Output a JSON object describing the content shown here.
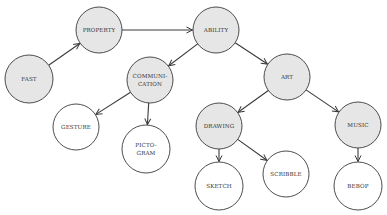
{
  "diagram": {
    "type": "concept-tree",
    "colors": {
      "filled": "#e6e6e6",
      "empty": "#ffffff",
      "stroke": "#3a3a3a",
      "text": "#333333"
    },
    "nodes": [
      {
        "id": "fast",
        "label": "FAST",
        "x": 29,
        "y": 79,
        "r": 24,
        "filled": true
      },
      {
        "id": "property",
        "label": "PROPERTY",
        "x": 99,
        "y": 30,
        "r": 23,
        "filled": true
      },
      {
        "id": "ability",
        "label": "ABILITY",
        "x": 216,
        "y": 30,
        "r": 23,
        "filled": true
      },
      {
        "id": "communication",
        "label": "COMMUNI-\nCATION",
        "x": 150,
        "y": 80,
        "r": 23,
        "filled": true
      },
      {
        "id": "art",
        "label": "ART",
        "x": 287,
        "y": 77,
        "r": 23,
        "filled": true
      },
      {
        "id": "gesture",
        "label": "GESTURE",
        "x": 76,
        "y": 127,
        "r": 23,
        "filled": false
      },
      {
        "id": "pictogram",
        "label": "PICTO-\nGRAM",
        "x": 146,
        "y": 149,
        "r": 24,
        "filled": false
      },
      {
        "id": "drawing",
        "label": "DRAWING",
        "x": 219,
        "y": 126,
        "r": 23,
        "filled": true
      },
      {
        "id": "music",
        "label": "MUSIC",
        "x": 358,
        "y": 125,
        "r": 23,
        "filled": true
      },
      {
        "id": "sketch",
        "label": "SKETCH",
        "x": 219,
        "y": 186,
        "r": 24,
        "filled": false
      },
      {
        "id": "scribble",
        "label": "SCRIBBLE",
        "x": 286,
        "y": 174,
        "r": 23,
        "filled": false
      },
      {
        "id": "bebop",
        "label": "BEBOP",
        "x": 358,
        "y": 186,
        "r": 24,
        "filled": false
      }
    ],
    "edges": [
      {
        "from": "fast",
        "to": "property"
      },
      {
        "from": "property",
        "to": "ability"
      },
      {
        "from": "ability",
        "to": "communication"
      },
      {
        "from": "ability",
        "to": "art"
      },
      {
        "from": "communication",
        "to": "gesture"
      },
      {
        "from": "communication",
        "to": "pictogram"
      },
      {
        "from": "art",
        "to": "drawing"
      },
      {
        "from": "art",
        "to": "music"
      },
      {
        "from": "drawing",
        "to": "sketch"
      },
      {
        "from": "drawing",
        "to": "scribble"
      },
      {
        "from": "music",
        "to": "bebop"
      }
    ]
  }
}
